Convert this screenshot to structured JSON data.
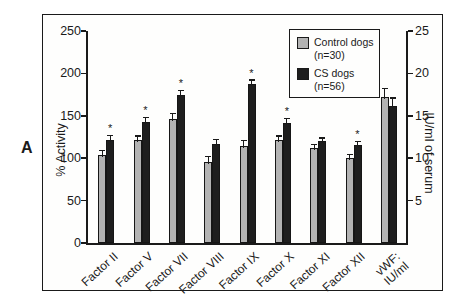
{
  "panel": {
    "label": "A"
  },
  "colors": {
    "control_bar": "#b3b3b3",
    "cs_bar": "#1e1e1e",
    "axis": "#1a1a1a",
    "background": "#ffffff"
  },
  "legend": {
    "items": [
      {
        "label": "Control dogs",
        "count": "(n=30)",
        "color": "#b3b3b3"
      },
      {
        "label": "CS dogs",
        "count": "(n=56)",
        "color": "#1e1e1e"
      }
    ]
  },
  "chart_data": {
    "type": "bar",
    "title": "",
    "categories": [
      "Factor II",
      "Factor V",
      "Factor VII",
      "Factor VIII",
      "Factor IX",
      "Factor X",
      "Factor XI",
      "Factor XII",
      "vWF:\nIU/ml"
    ],
    "series": [
      {
        "name": "Control dogs (n=30)",
        "color": "#b3b3b3",
        "values": [
          104,
          122,
          146,
          96,
          114,
          122,
          112,
          100,
          172
        ],
        "errors": [
          5,
          4,
          7,
          6,
          7,
          4,
          4,
          4,
          10
        ]
      },
      {
        "name": "CS dogs (n=56)",
        "color": "#1e1e1e",
        "values": [
          122,
          143,
          174,
          117,
          187,
          142,
          120,
          115,
          161
        ],
        "errors": [
          5,
          5,
          6,
          5,
          5,
          5,
          4,
          5,
          10
        ]
      }
    ],
    "significant_cs": [
      true,
      true,
      true,
      false,
      true,
      true,
      false,
      true,
      false
    ],
    "significance_marker": "*",
    "ylabel_left": "% Activity",
    "ylabel_right": "IU/ml of serum",
    "yticks_left": [
      0,
      50,
      100,
      150,
      200,
      250
    ],
    "yticks_right": [
      5,
      10,
      15,
      20,
      25
    ],
    "ylim_left": [
      0,
      250
    ],
    "ylim_right": [
      0,
      25
    ],
    "vwf_right_axis_values_iu_ml": {
      "control": 17.2,
      "cs": 16.1
    },
    "grid": "off",
    "legend_position": "top-right-inside"
  }
}
